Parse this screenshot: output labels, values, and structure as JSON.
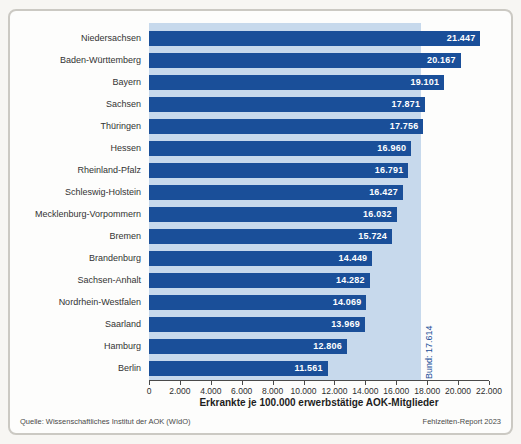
{
  "figure": {
    "source": "Quelle: Wissenschaftliches Institut der AOK (WIdO)",
    "report": "Fehlzeiten-Report 2023"
  },
  "chart_data": {
    "type": "bar",
    "orientation": "horizontal",
    "title": "",
    "xlabel": "Erkrankte je 100.000 erwerbstätige AOK-Mitglieder",
    "ylabel": "",
    "xlim": [
      0,
      22000
    ],
    "grid": false,
    "legend": null,
    "categories": [
      "Niedersachsen",
      "Baden-Württemberg",
      "Bayern",
      "Sachsen",
      "Thüringen",
      "Hessen",
      "Rheinland-Pfalz",
      "Schleswig-Holstein",
      "Mecklenburg-Vorpommern",
      "Bremen",
      "Brandenburg",
      "Sachsen-Anhalt",
      "Nordrhein-Westfalen",
      "Saarland",
      "Hamburg",
      "Berlin"
    ],
    "values": [
      21447,
      20167,
      19101,
      17871,
      17756,
      16960,
      16791,
      16427,
      16032,
      15724,
      14449,
      14282,
      14069,
      13969,
      12806,
      11561
    ],
    "value_labels": [
      "21.447",
      "20.167",
      "19.101",
      "17.871",
      "17.756",
      "16.960",
      "16.791",
      "16.427",
      "16.032",
      "15.724",
      "14.449",
      "14.282",
      "14.069",
      "13.969",
      "12.806",
      "11.561"
    ],
    "x_ticks": [
      {
        "value": 0,
        "label": "0"
      },
      {
        "value": 2000,
        "label": "2.000"
      },
      {
        "value": 4000,
        "label": "4.000"
      },
      {
        "value": 6000,
        "label": "6.000"
      },
      {
        "value": 8000,
        "label": "8.000"
      },
      {
        "value": 10000,
        "label": "10.000"
      },
      {
        "value": 12000,
        "label": "12.000"
      },
      {
        "value": 14000,
        "label": "14.000"
      },
      {
        "value": 16000,
        "label": "16.000"
      },
      {
        "value": 18000,
        "label": "18.000"
      },
      {
        "value": 20000,
        "label": "20.000"
      },
      {
        "value": 22000,
        "label": "22.000"
      }
    ],
    "reference_band": {
      "label": "Bund: 17.614",
      "value": 17614
    },
    "colors": {
      "bar": "#1a4f99",
      "band": "#c7d9ec",
      "value_text": "#ffffff",
      "reference_text": "#1a4f99",
      "axis": "#4a4a4a"
    }
  }
}
